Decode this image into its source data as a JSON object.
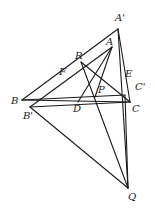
{
  "diagram": {
    "type": "geometry",
    "stroke_color": "#1a1a1a",
    "points": {
      "A1": {
        "label": "A'",
        "x": 118,
        "y": 29,
        "lx": 115,
        "ly": 21
      },
      "A": {
        "label": "A",
        "x": 112,
        "y": 47,
        "lx": 106,
        "ly": 45
      },
      "R": {
        "label": "R",
        "x": 81,
        "y": 62,
        "lx": 75,
        "ly": 59
      },
      "F": {
        "label": "F",
        "x": 62,
        "y": 74,
        "lx": 59,
        "ly": 75
      },
      "B": {
        "label": "B",
        "x": 22,
        "y": 100,
        "lx": 11,
        "ly": 104
      },
      "B1": {
        "label": "B'",
        "x": 30,
        "y": 107,
        "lx": 23,
        "ly": 119
      },
      "P": {
        "label": "P",
        "x": 95,
        "y": 97,
        "lx": 98,
        "ly": 93
      },
      "E": {
        "label": "E",
        "x": 124,
        "y": 80,
        "lx": 125,
        "ly": 77
      },
      "C1": {
        "label": "C'",
        "x": 125,
        "y": 95,
        "lx": 135,
        "ly": 90
      },
      "C": {
        "label": "C",
        "x": 130,
        "y": 102,
        "lx": 132,
        "ly": 112
      },
      "D": {
        "label": "D",
        "x": 78,
        "y": 102,
        "lx": 73,
        "ly": 112
      },
      "Q": {
        "label": "Q",
        "x": 128,
        "y": 188,
        "lx": 128,
        "ly": 200
      }
    },
    "segments": [
      [
        "B",
        "A1"
      ],
      [
        "A1",
        "C"
      ],
      [
        "B",
        "C"
      ],
      [
        "B",
        "C1"
      ],
      [
        "B1",
        "A"
      ],
      [
        "B1",
        "C"
      ],
      [
        "A",
        "P"
      ],
      [
        "R",
        "C"
      ],
      [
        "R",
        "Q"
      ],
      [
        "B1",
        "Q"
      ],
      [
        "A1",
        "Q"
      ],
      [
        "A",
        "D"
      ],
      [
        "C1",
        "Q"
      ]
    ]
  }
}
